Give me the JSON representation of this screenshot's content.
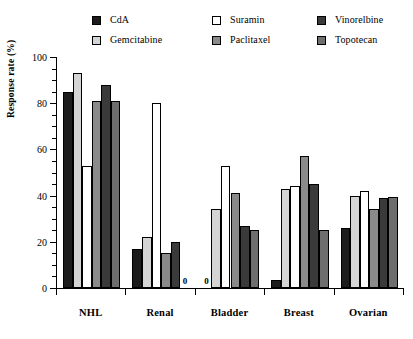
{
  "chart_data": {
    "type": "bar",
    "title": "",
    "xlabel": "",
    "ylabel": "Response rate (%)",
    "ylim": [
      0,
      100
    ],
    "ytick_labels": [
      "0",
      "20",
      "40",
      "60",
      "80",
      "100"
    ],
    "ytick_values": [
      0,
      20,
      40,
      60,
      80,
      100
    ],
    "yminor_step": 5,
    "grid": false,
    "legend_position": "top",
    "categories": [
      "NHL",
      "Renal",
      "Bladder",
      "Breast",
      "Ovarian"
    ],
    "series": [
      {
        "name": "CdA",
        "color": "#1c1c1c",
        "values": [
          85,
          17,
          0,
          3.5,
          26
        ]
      },
      {
        "name": "Gemcitabine",
        "color": "#d4d4d4",
        "values": [
          93,
          22,
          34,
          43,
          40
        ]
      },
      {
        "name": "Suramin",
        "color": "#ffffff",
        "values": [
          53,
          80,
          53,
          44,
          42
        ]
      },
      {
        "name": "Paclitaxel",
        "color": "#8a8a8a",
        "values": [
          81,
          15,
          41,
          57,
          34
        ]
      },
      {
        "name": "Vinorelbine",
        "color": "#3a3a3a",
        "values": [
          88,
          20,
          27,
          45,
          39
        ]
      },
      {
        "name": "Topotecan",
        "color": "#6e6e6e",
        "values": [
          81,
          0,
          25,
          25,
          39.5
        ]
      }
    ],
    "zero_annotations": [
      {
        "label": "0",
        "category": "Renal",
        "series": "Topotecan"
      },
      {
        "label": "0",
        "category": "Bladder",
        "series": "CdA"
      }
    ]
  },
  "legend": {
    "columns": [
      [
        {
          "label": "CdA",
          "swatch": "legend-swatch-cda"
        },
        {
          "label": "Gemcitabine",
          "swatch": "legend-swatch-gemcitabine"
        }
      ],
      [
        {
          "label": "Suramin",
          "swatch": "legend-swatch-suramin"
        },
        {
          "label": "Paclitaxel",
          "swatch": "legend-swatch-paclitaxel"
        }
      ],
      [
        {
          "label": "Vinorelbine",
          "swatch": "legend-swatch-vinorelbine"
        },
        {
          "label": "Topotecan",
          "swatch": "legend-swatch-topotecan"
        }
      ]
    ]
  }
}
